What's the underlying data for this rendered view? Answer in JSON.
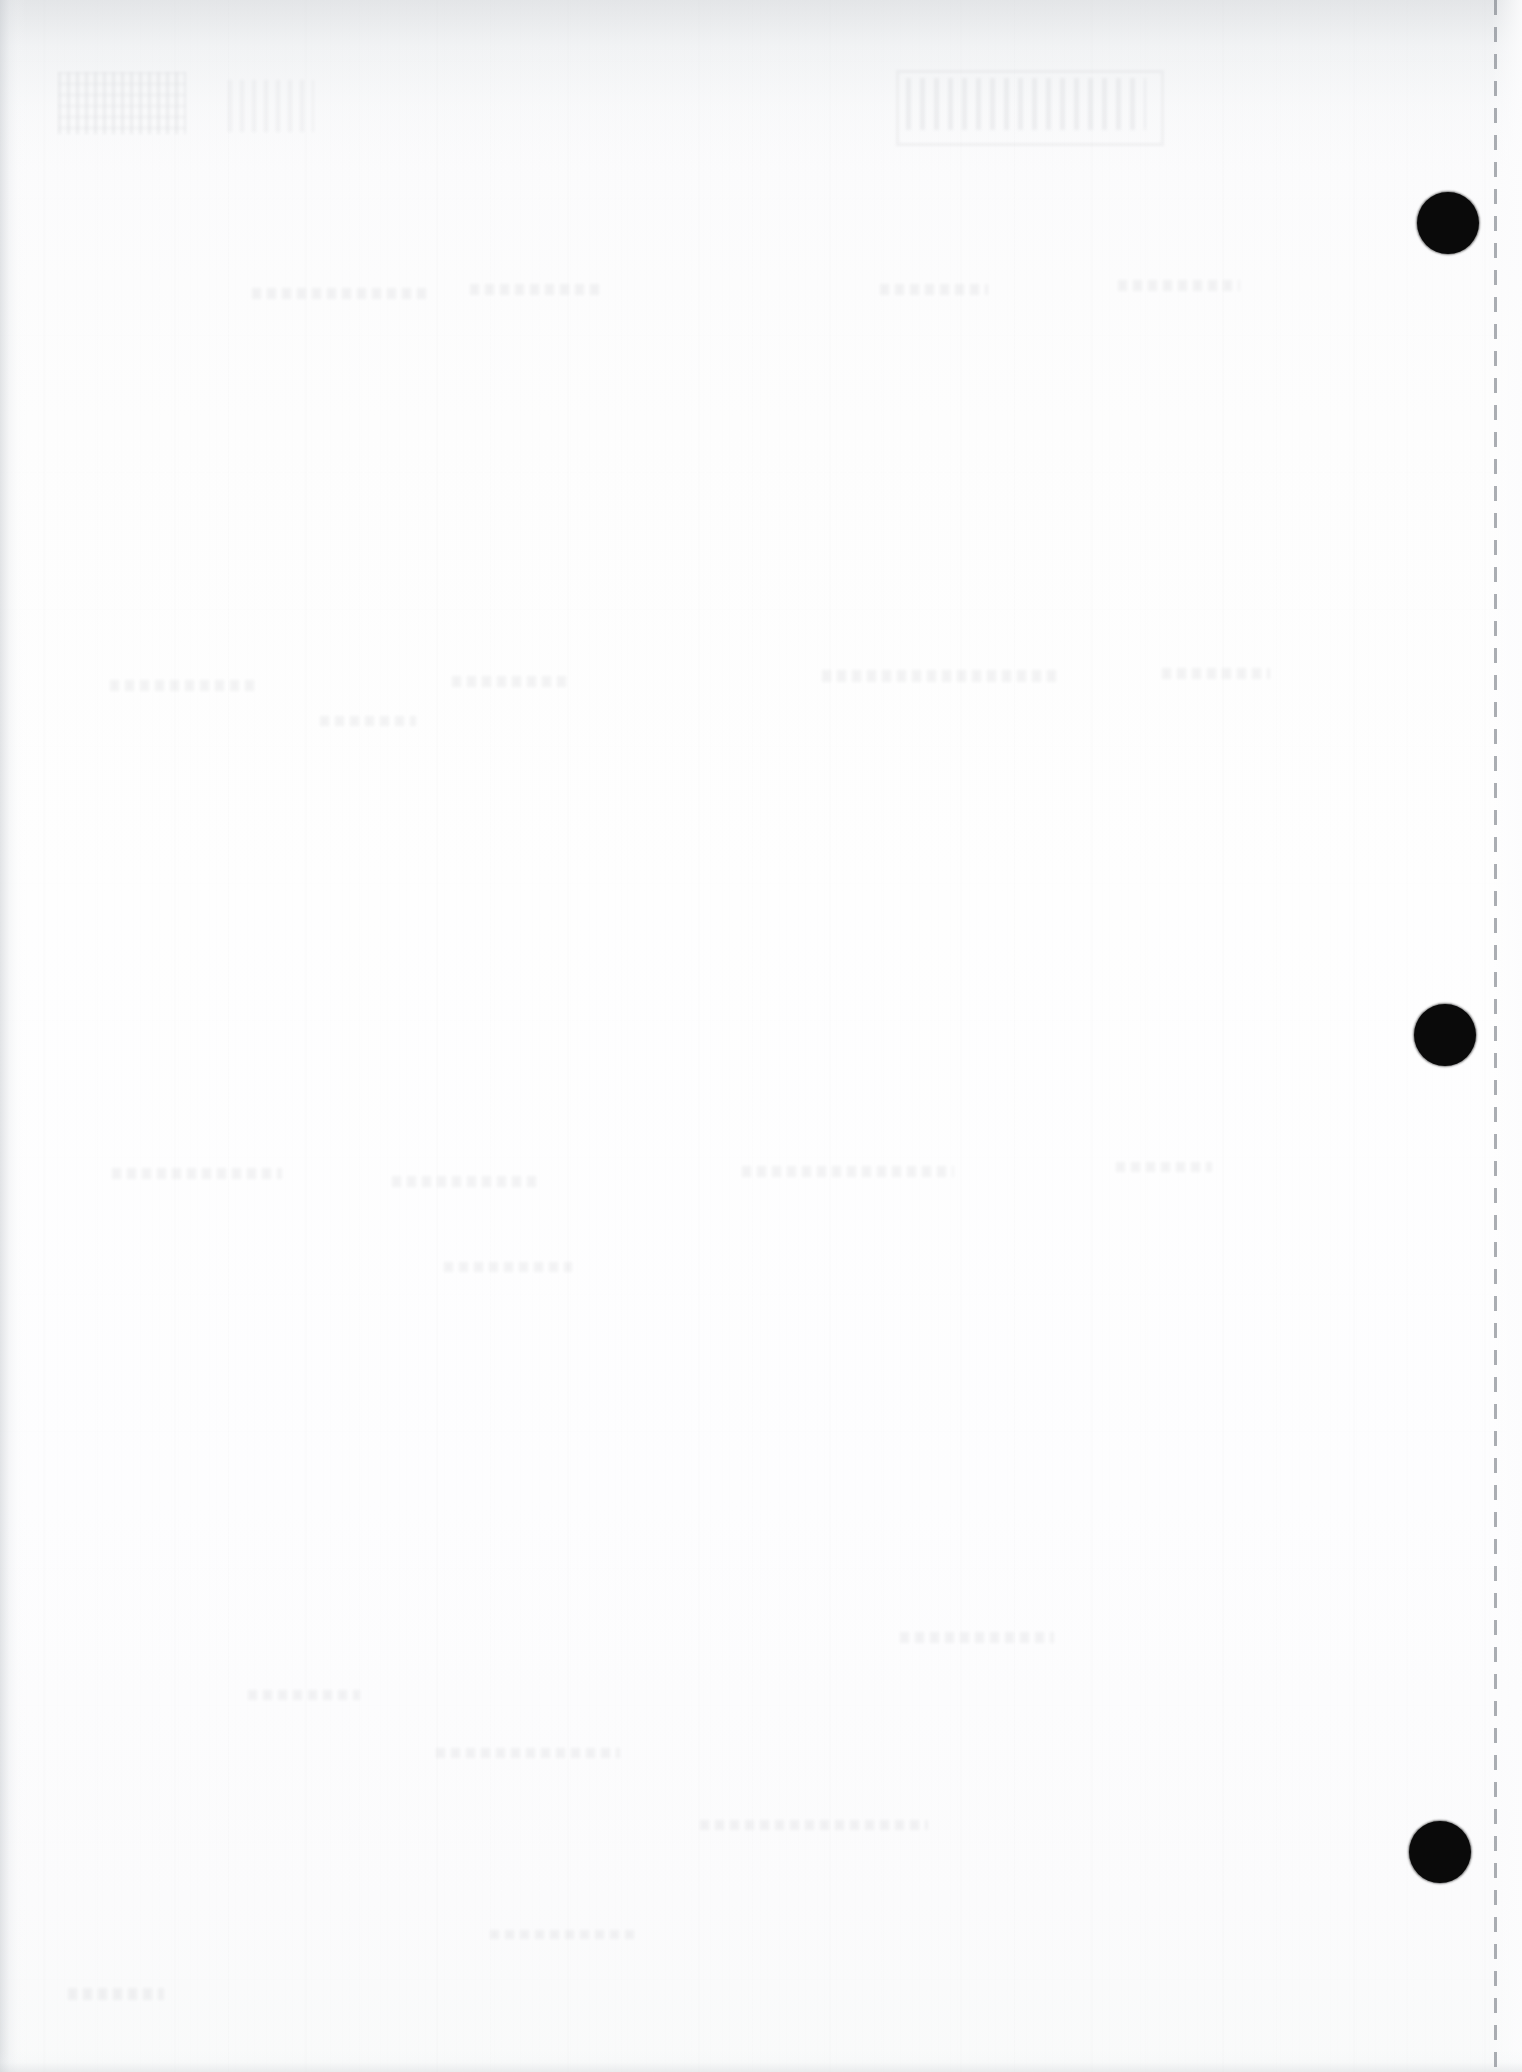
{
  "document": {
    "kind": "scanned-page",
    "description": "Blank reverse side (verso) of a scanned paper document",
    "page_width": 1522,
    "page_height": 2072,
    "paper_color": "#fcfcfd",
    "body_text": "",
    "visible_text": []
  },
  "features": {
    "perforation": {
      "name": "dashed perforation line",
      "orientation": "vertical",
      "x": 1494,
      "dash_length": 15,
      "dash_gap": 12,
      "color": "#787d85"
    },
    "hole_punches": {
      "name": "three-hole punch marks",
      "count": 3,
      "color": "#0a0a0a",
      "diameter": 62,
      "positions": [
        {
          "cx": 1448,
          "cy": 223
        },
        {
          "cx": 1445,
          "cy": 1035
        },
        {
          "cx": 1440,
          "cy": 1852
        }
      ]
    },
    "show_through": {
      "name": "ghost show-through from reverse side",
      "legible": false,
      "regions": [
        "upper-left",
        "upper-right",
        "mid-page",
        "lower-left"
      ]
    },
    "scan_artifacts": {
      "top_band": "darkened horizontal scan band across top ~170px",
      "left_edge_shadow": "soft vertical shadow along left edge ~26px",
      "grain": "vertical paper grain / scanner streaks"
    }
  }
}
